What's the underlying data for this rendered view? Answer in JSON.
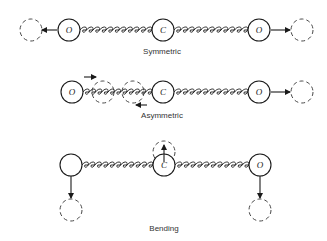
{
  "figure": {
    "modes": [
      {
        "name": "Symmetric",
        "atoms": [
          {
            "label": "O",
            "x": 69,
            "y": 30
          },
          {
            "label": "C",
            "x": 163,
            "y": 30
          },
          {
            "label": "O",
            "x": 259,
            "y": 30
          }
        ],
        "ghosts": [
          {
            "x": 31,
            "y": 30
          },
          {
            "x": 302,
            "y": 30
          }
        ],
        "arrows": [
          {
            "x1": 57,
            "y1": 30,
            "x2": 42,
            "y2": 30
          },
          {
            "x1": 271,
            "y1": 30,
            "x2": 290,
            "y2": 30
          }
        ],
        "caption": {
          "text": "Symmetric",
          "x": 162,
          "y": 54
        }
      },
      {
        "name": "Asymmetric",
        "atoms": [
          {
            "label": "O",
            "x": 72,
            "y": 92
          },
          {
            "label": "C",
            "x": 163,
            "y": 92
          },
          {
            "label": "O",
            "x": 259,
            "y": 92
          }
        ],
        "ghosts": [
          {
            "x": 103,
            "y": 92
          },
          {
            "x": 133,
            "y": 92
          },
          {
            "x": 302,
            "y": 92
          }
        ],
        "arrows": [
          {
            "x1": 84,
            "y1": 77,
            "x2": 96,
            "y2": 77
          },
          {
            "x1": 147,
            "y1": 105,
            "x2": 136,
            "y2": 105
          },
          {
            "x1": 271,
            "y1": 92,
            "x2": 290,
            "y2": 92
          }
        ],
        "caption": {
          "text": "Asymmetric",
          "x": 162,
          "y": 118
        }
      },
      {
        "name": "Bending",
        "atoms": [
          {
            "label": "",
            "x": 71,
            "y": 165
          },
          {
            "label": "C",
            "x": 164,
            "y": 165
          },
          {
            "label": "O",
            "x": 260,
            "y": 165
          }
        ],
        "ghosts": [
          {
            "x": 71,
            "y": 210
          },
          {
            "x": 164,
            "y": 152
          },
          {
            "x": 260,
            "y": 210
          }
        ],
        "arrows": [
          {
            "x1": 71,
            "y1": 176,
            "x2": 71,
            "y2": 198
          },
          {
            "x1": 164,
            "y1": 162,
            "x2": 164,
            "y2": 145
          },
          {
            "x1": 260,
            "y1": 176,
            "x2": 260,
            "y2": 198
          }
        ],
        "caption": {
          "text": "Bending",
          "x": 164,
          "y": 231
        }
      }
    ]
  }
}
